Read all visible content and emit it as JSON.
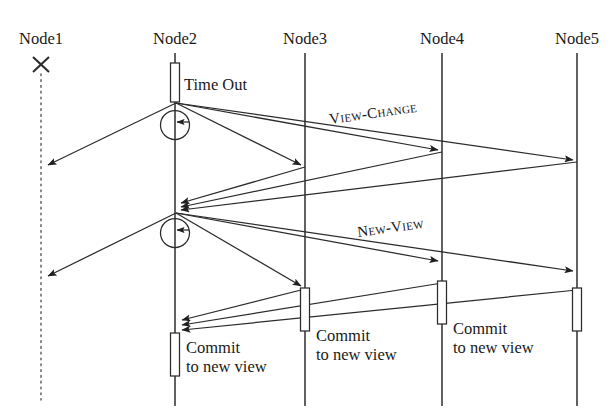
{
  "diagram": {
    "type": "uml-sequence-diagram",
    "title_visible": false,
    "width": 615,
    "height": 412,
    "background_color": "#ffffff",
    "line_color": "#2b2b2b",
    "lifelines": [
      {
        "id": "node1",
        "label": "Node1",
        "x": 41,
        "label_y": 44,
        "style": "dotted",
        "crashed": true,
        "crash_marker": "x",
        "crash_y": 65
      },
      {
        "id": "node2",
        "label": "Node2",
        "x": 175,
        "label_y": 44,
        "style": "solid",
        "crashed": false
      },
      {
        "id": "node3",
        "label": "Node3",
        "x": 305,
        "label_y": 44,
        "style": "solid",
        "crashed": false
      },
      {
        "id": "node4",
        "label": "Node4",
        "x": 442,
        "label_y": 44,
        "style": "solid",
        "crashed": false
      },
      {
        "id": "node5",
        "label": "Node5",
        "x": 577,
        "label_y": 44,
        "style": "solid",
        "crashed": false
      }
    ],
    "activations": [
      {
        "id": "act-node2-timeout",
        "lifeline": "node2",
        "x": 175,
        "y": 63,
        "height": 39,
        "width": 9
      },
      {
        "id": "act-node3-commit",
        "lifeline": "node3",
        "x": 305,
        "y": 288,
        "height": 43,
        "width": 9
      },
      {
        "id": "act-node4-commit",
        "lifeline": "node4",
        "x": 442,
        "y": 281,
        "height": 43,
        "width": 9
      },
      {
        "id": "act-node5-commit",
        "lifeline": "node5",
        "x": 577,
        "y": 288,
        "height": 43,
        "width": 9
      },
      {
        "id": "act-node2-commit",
        "lifeline": "node2",
        "x": 175,
        "y": 333,
        "height": 43,
        "width": 9
      }
    ],
    "self_loops": [
      {
        "id": "loop-node2-viewchange",
        "lifeline": "node2",
        "cx": 175,
        "cy": 125,
        "r": 14.5
      },
      {
        "id": "loop-node2-newview",
        "lifeline": "node2",
        "cx": 175,
        "cy": 233,
        "r": 14.5
      }
    ],
    "messages": [
      {
        "id": "vc-n2-n1",
        "from": "node2",
        "to": "node1",
        "x1": 176,
        "y1": 103,
        "x2": 44,
        "y2": 167,
        "arrow": true
      },
      {
        "id": "vc-n2-n3",
        "from": "node2",
        "to": "node3",
        "x1": 176,
        "y1": 103,
        "x2": 303,
        "y2": 167,
        "arrow": true
      },
      {
        "id": "vc-n2-n4",
        "from": "node2",
        "to": "node4",
        "x1": 176,
        "y1": 103,
        "x2": 440,
        "y2": 151,
        "arrow": true
      },
      {
        "id": "vc-n2-n5",
        "from": "node2",
        "to": "node5",
        "x1": 176,
        "y1": 103,
        "x2": 575,
        "y2": 161,
        "arrow": true
      },
      {
        "id": "vc-n3-n2",
        "from": "node3",
        "to": "node2",
        "x1": 305,
        "y1": 167,
        "x2": 178,
        "y2": 203,
        "arrow": true
      },
      {
        "id": "vc-n4-n2",
        "from": "node4",
        "to": "node2",
        "x1": 442,
        "y1": 152,
        "x2": 178,
        "y2": 207,
        "arrow": true
      },
      {
        "id": "vc-n5-n2",
        "from": "node5",
        "to": "node2",
        "x1": 577,
        "y1": 162,
        "x2": 178,
        "y2": 211,
        "arrow": true
      },
      {
        "id": "nv-n2-n1",
        "from": "node2",
        "to": "node1",
        "x1": 176,
        "y1": 213,
        "x2": 44,
        "y2": 278,
        "arrow": true
      },
      {
        "id": "nv-n2-n3",
        "from": "node2",
        "to": "node3",
        "x1": 176,
        "y1": 213,
        "x2": 303,
        "y2": 288,
        "arrow": true
      },
      {
        "id": "nv-n2-n4",
        "from": "node2",
        "to": "node4",
        "x1": 176,
        "y1": 213,
        "x2": 440,
        "y2": 262,
        "arrow": true
      },
      {
        "id": "nv-n2-n5",
        "from": "node2",
        "to": "node5",
        "x1": 176,
        "y1": 213,
        "x2": 575,
        "y2": 272,
        "arrow": true
      },
      {
        "id": "cm-n3-n2",
        "from": "node3",
        "to": "node2",
        "x1": 305,
        "y1": 289,
        "x2": 179,
        "y2": 320,
        "arrow": true
      },
      {
        "id": "cm-n4-n2",
        "from": "node4",
        "to": "node2",
        "x1": 442,
        "y1": 283,
        "x2": 179,
        "y2": 325,
        "arrow": true
      },
      {
        "id": "cm-n5-n2",
        "from": "node5",
        "to": "node2",
        "x1": 577,
        "y1": 290,
        "x2": 179,
        "y2": 330,
        "arrow": true
      }
    ],
    "labels": [
      {
        "id": "label-timeout",
        "text": "Time Out",
        "x": 184,
        "y": 90,
        "style": "plain",
        "rotation": 0
      },
      {
        "id": "label-view-change",
        "text": "View-Change",
        "x": 330,
        "y": 124,
        "style": "small-caps",
        "rotation": -8
      },
      {
        "id": "label-new-view",
        "text": "New-View",
        "x": 358,
        "y": 237,
        "style": "small-caps",
        "rotation": -8
      },
      {
        "id": "label-commit-node2",
        "text_line1": "Commit",
        "text_line2": "to new view",
        "x": 186,
        "y": 347,
        "style": "plain",
        "rotation": 0
      },
      {
        "id": "label-commit-node3",
        "text_line1": "Commit",
        "text_line2": "to new view",
        "x": 316,
        "y": 337,
        "style": "plain",
        "rotation": 0
      },
      {
        "id": "label-commit-node4",
        "text_line1": "Commit",
        "text_line2": "to new view",
        "x": 453,
        "y": 330,
        "style": "plain",
        "rotation": 0
      }
    ],
    "message_label_texts": {
      "view_change": "View-Change",
      "new_view": "New-View",
      "time_out": "Time Out",
      "commit_line1": "Commit",
      "commit_line2": "to new view"
    }
  }
}
